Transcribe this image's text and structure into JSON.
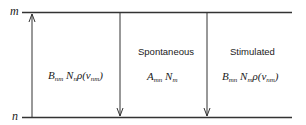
{
  "levels": {
    "upper": "m",
    "lower": "n"
  },
  "transitions": [
    {
      "name": "absorption",
      "direction": "up",
      "label": "",
      "formula": {
        "B": "B",
        "B_sub": "nm",
        "N": "N",
        "N_sub": "n",
        "rho": "ρ(ν",
        "nu_sub": "nm",
        "close": ")"
      }
    },
    {
      "name": "spontaneous",
      "direction": "down",
      "label": "Spontaneous",
      "formula": {
        "A": "A",
        "A_sub": "mn",
        "N": "N",
        "N_sub": "m"
      }
    },
    {
      "name": "stimulated",
      "direction": "down",
      "label": "Stimulated",
      "formula": {
        "B": "B",
        "B_sub": "mn",
        "N": "N",
        "N_sub": "m",
        "rho": "ρ(ν",
        "nu_sub": "nm",
        "close": ")"
      }
    }
  ]
}
